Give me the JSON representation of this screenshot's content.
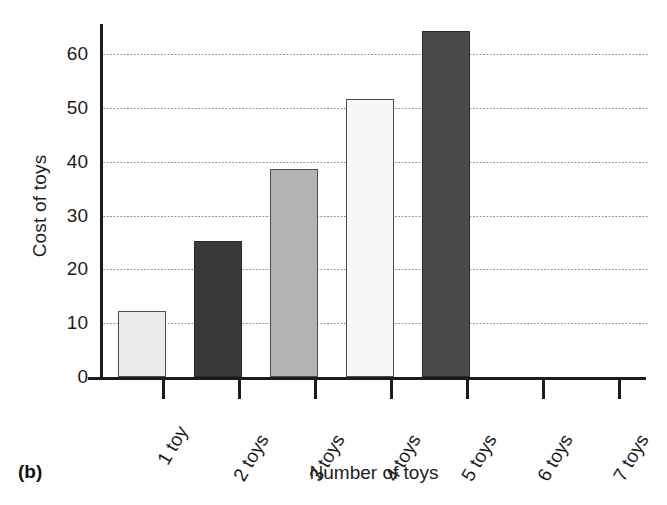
{
  "chart_data": {
    "type": "bar",
    "title": "",
    "panel_label": "(b)",
    "xlabel": "Number of toys",
    "ylabel": "Cost of toys",
    "categories": [
      "1 toy",
      "2 toys",
      "3 toys",
      "4 toys",
      "5 toys",
      "6 toys",
      "7 toys"
    ],
    "values": [
      12.3,
      25.3,
      38.7,
      51.7,
      64.4,
      0,
      0
    ],
    "bar_colors": [
      "#ebebeb",
      "#3a3a3a",
      "#b3b3b3",
      "#f7f7f7",
      "#4a4a4a",
      "#ffffff",
      "#ffffff"
    ],
    "ylim": [
      0,
      66
    ],
    "yticks": [
      0,
      10,
      20,
      30,
      40,
      50,
      60
    ],
    "ytick_labels": [
      "0",
      "10",
      "20",
      "30",
      "40",
      "50",
      "60"
    ],
    "grid": true,
    "grid_style": "dotted",
    "grid_axis": "y",
    "legend": false,
    "legend_position": "none",
    "axis_color": "#1c1c1c",
    "grid_color": "#8a8a8a",
    "background": "#ffffff"
  },
  "axis": {
    "y_title": "Cost of toys",
    "x_title": "Number of toys"
  },
  "caption": {
    "panel": "(b)"
  }
}
